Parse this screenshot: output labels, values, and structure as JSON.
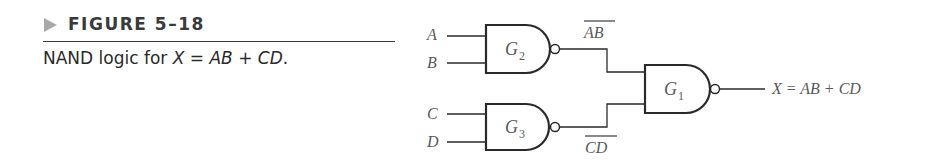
{
  "figure": {
    "label": "FIGURE 5–18",
    "caption_prefix": "NAND logic for ",
    "caption_x": "X",
    "caption_eq": " = ",
    "caption_ab": "AB",
    "caption_plus": " + ",
    "caption_cd": "CD",
    "caption_end": "."
  },
  "diagram": {
    "inputs": [
      "A",
      "B",
      "C",
      "D"
    ],
    "gates": [
      {
        "id": "G2",
        "name": "G",
        "sub": "2",
        "type": "NAND"
      },
      {
        "id": "G3",
        "name": "G",
        "sub": "3",
        "type": "NAND"
      },
      {
        "id": "G1",
        "name": "G",
        "sub": "1",
        "type": "NAND"
      }
    ],
    "intermediate": {
      "g2_out": "AB",
      "g3_out": "CD"
    },
    "output_label": "X = AB + CD"
  }
}
